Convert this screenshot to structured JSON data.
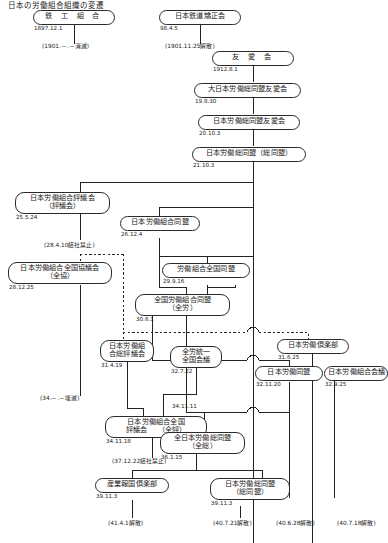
{
  "header": {
    "title": "日本の労働組合組織の変遷"
  },
  "diagram": {
    "type": "organizational-genealogy-flowchart",
    "period": "1897-1941",
    "nodes": [
      {
        "id": "n1",
        "name": "鉄 工 組 合",
        "name2": "",
        "date": "1897.12.1"
      },
      {
        "id": "n2",
        "name": "日本鉄道矯正会",
        "name2": "",
        "date": "98.4.5"
      },
      {
        "id": "n3",
        "name": "友  愛  会",
        "name2": "",
        "date": "1912.8.1"
      },
      {
        "id": "n4",
        "name": "大日本労働総同盟友愛会",
        "name2": "",
        "date": "19.8.30"
      },
      {
        "id": "n5",
        "name": "日本労働総同盟友愛会",
        "name2": "",
        "date": "20.10.3"
      },
      {
        "id": "n6",
        "name": "日本労働総同盟（総同盟）",
        "name2": "",
        "date": "21.10.3"
      },
      {
        "id": "n7",
        "name": "日本労働組合評議会",
        "name2": "（評議会）",
        "date": "25.5.24"
      },
      {
        "id": "n8",
        "name": "日本労働組合同盟",
        "name2": "",
        "date": "26.12.4"
      },
      {
        "id": "n9",
        "name": "日本労働組合全国協議会",
        "name2": "（全協）",
        "date": "28.12.25"
      },
      {
        "id": "n10",
        "name": "労働組合全国同盟",
        "name2": "",
        "date": "29.9.16"
      },
      {
        "id": "n11",
        "name": "全国労働組合同盟",
        "name2": "（全労）",
        "date": "30.6.1"
      },
      {
        "id": "n12",
        "name": "日本労働組",
        "name2": "合総評議会",
        "date": "31.4.19"
      },
      {
        "id": "n13",
        "name": "日本労働倶楽部",
        "name2": "",
        "date": "31.6.25"
      },
      {
        "id": "n14",
        "name": "全労統一",
        "name2": "全国会議",
        "date": "32.7.22"
      },
      {
        "id": "n15",
        "name": "日本労働同盟",
        "name2": "",
        "date": "32.11.20"
      },
      {
        "id": "n16",
        "name": "日本労働組合会議",
        "name2": "",
        "date": "32.9.25"
      },
      {
        "id": "n17",
        "name": "日本労働組合全国",
        "name2": "評議会　　（全評）",
        "date": "34.11.18"
      },
      {
        "id": "n18",
        "name": "全日本労働総同盟",
        "name2": "（全総）",
        "date": "36.1.15"
      },
      {
        "id": "n19",
        "name": "産業報国倶楽部",
        "name2": "",
        "date": "39.11.3"
      },
      {
        "id": "n20",
        "name": "日本労働総同盟",
        "name2": "（総同盟）",
        "date": "39.11.3"
      }
    ],
    "notes": [
      {
        "id": "t1",
        "text": "(1901.－.－消滅)"
      },
      {
        "id": "t2",
        "text": "(1901.11.25解散)"
      },
      {
        "id": "t3",
        "text": "(28.4.10結社禁止)"
      },
      {
        "id": "t4",
        "text": "(34.－.－壊滅)"
      },
      {
        "id": "t5",
        "text": "(37.12.22結社禁止)"
      },
      {
        "id": "t6",
        "text": "(41.4.1解散)"
      },
      {
        "id": "t7",
        "text": "(40.7.21解散)"
      },
      {
        "id": "t8",
        "text": "(40.6.28解散)"
      },
      {
        "id": "t9",
        "text": "(40.7.18解散)"
      }
    ],
    "edge_dates": [
      {
        "id": "e1",
        "text": "34.11.11"
      }
    ]
  }
}
